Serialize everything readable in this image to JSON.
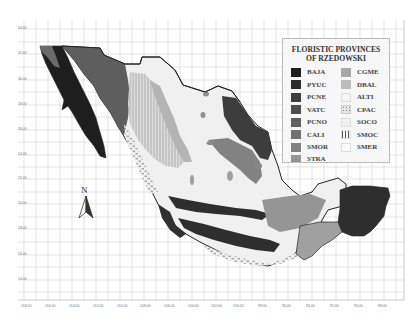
{
  "legend": {
    "title_line1": "FLORISTIC PROVINCES",
    "title_line2": "OF RZEDOWSKI",
    "items_left": [
      {
        "code": "BAJA",
        "color": "#1e1e1e"
      },
      {
        "code": "PYUC",
        "color": "#2e2e2e"
      },
      {
        "code": "PCNE",
        "color": "#3d3d3d"
      },
      {
        "code": "VATC",
        "color": "#4c4c4c"
      },
      {
        "code": "PCNO",
        "color": "#5e5e5e"
      },
      {
        "code": "CALI",
        "color": "#707070"
      },
      {
        "code": "SMOR",
        "color": "#828282"
      },
      {
        "code": "STRA",
        "color": "#959595"
      }
    ],
    "items_right": [
      {
        "code": "CGME",
        "color": "#a8a8a8"
      },
      {
        "code": "DBAL",
        "color": "#bcbcbc"
      },
      {
        "code": "ALTI",
        "color": "#f5f5f5"
      },
      {
        "code": "CPAC",
        "color": "#cfcfcf"
      },
      {
        "code": "SOCO",
        "color": "#f0f0f0"
      },
      {
        "code": "SMOC",
        "color": "#d8d8d8"
      },
      {
        "code": "SMER",
        "color": "#fafafa"
      }
    ]
  },
  "north_arrow": {
    "label": "N"
  },
  "axes": {
    "y_labels": [
      "34.00",
      "32.00",
      "30.00",
      "28.00",
      "26.00",
      "24.00",
      "22.00",
      "20.00",
      "18.00",
      "16.00",
      "14.00"
    ],
    "x_labels": [
      "118.00",
      "116.00",
      "114.00",
      "112.00",
      "110.00",
      "108.00",
      "106.00",
      "104.00",
      "102.00",
      "100.00",
      "98.00",
      "96.00",
      "94.00",
      "92.00",
      "90.00",
      "88.00"
    ]
  }
}
